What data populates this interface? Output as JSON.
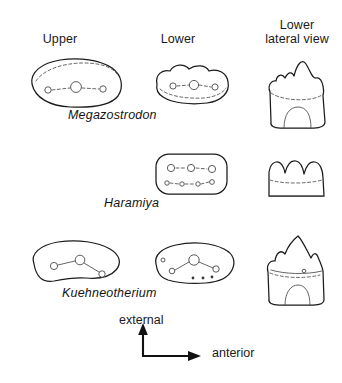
{
  "figure": {
    "background_color": "#ffffff",
    "ink_color": "#1b1b1b"
  },
  "columns": [
    {
      "key": "upper",
      "label": "Upper"
    },
    {
      "key": "lower",
      "label": "Lower"
    },
    {
      "key": "lateral",
      "label": "Lower\nlateral view"
    }
  ],
  "rows": [
    {
      "key": "megazostrodon",
      "taxon": "Megazostrodon",
      "upper": {
        "shape": "ovoid crown, outline with dashed internal cingulum arc",
        "cusps": 3,
        "cusp_row_layout": "single linear row of three circles joined by dashed line"
      },
      "lower": {
        "shape": "lobed scalloped crown",
        "cusps": 3,
        "cusp_row_layout": "single linear row of three circles joined by dashed line"
      },
      "lateral": {
        "shape": "crown with three cusps, tall central cusp, dashed cingulum, single root with internal arch",
        "cusps": 3,
        "root": "single root with pulp arch"
      }
    },
    {
      "key": "haramiya",
      "taxon": "Haramiya",
      "upper": null,
      "lower": {
        "shape": "rounded rectangular crown",
        "cusps": 7,
        "cusp_row_layout": "two longitudinal rows: three larger circles above, four smaller circles below joined by dashed lines"
      },
      "lateral": {
        "shape": "three low rounded cusps above dashed cingulum line, flat base",
        "cusps": 3,
        "root": "flat base, no root shown"
      }
    },
    {
      "key": "kuehneotherium",
      "taxon": "Kuehneotherium",
      "upper": {
        "shape": "bean-shaped crown",
        "cusps": 3,
        "cusp_row_layout": "triangular zigzag arrangement of three circles joined by thin lines"
      },
      "lower": {
        "shape": "curved crescent crown",
        "cusps": 3,
        "cusp_row_layout": "zigzag of three circles with small accessory dots along lower margin"
      },
      "lateral": {
        "shape": "tall pointed main cusp with smaller accessory cusp on left, cingulum, root with internal arch",
        "cusps": 3,
        "root": "root with pulp arch"
      }
    }
  ],
  "orientation_key": {
    "vertical": {
      "label": "external",
      "direction": "up"
    },
    "horizontal": {
      "label": "anterior",
      "direction": "right"
    }
  }
}
